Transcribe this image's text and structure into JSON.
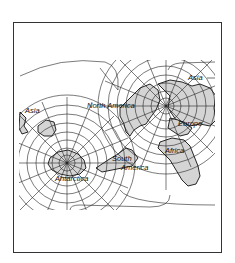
{
  "map": {
    "type": "world-map-projection",
    "style": "two-pole graticule projection",
    "colors": {
      "land": "#d4d4d4",
      "outline": "#111111",
      "grid": "#222222",
      "background": "#ffffff",
      "frame": "#333333"
    },
    "poles": {
      "north": {
        "x": 166,
        "y": 106
      },
      "south": {
        "x": 67,
        "y": 163
      }
    },
    "labels": {
      "asia_east": "Asia",
      "asia_west": "Asia",
      "north_america": "North America",
      "europe": "Europe",
      "africa": "Africa",
      "south_america_1": "South",
      "south_america_2": "America",
      "antarctica": "Antarctica"
    }
  }
}
